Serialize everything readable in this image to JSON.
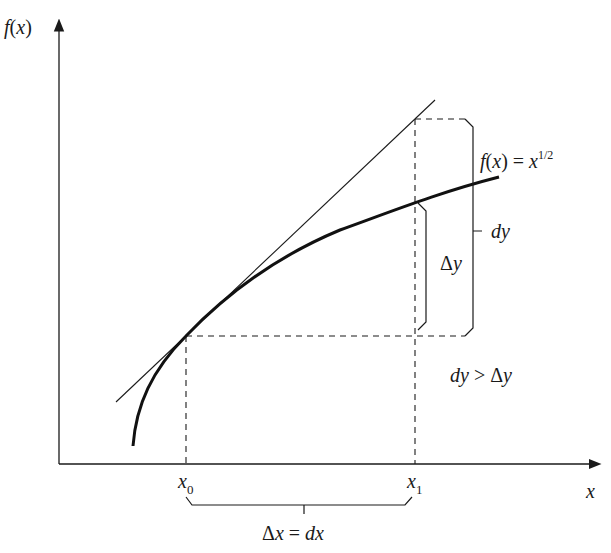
{
  "diagram": {
    "axes": {
      "y_label_f": "f",
      "y_label_open": "(",
      "y_label_x": "x",
      "y_label_close": ")",
      "x_label": "x"
    },
    "function_label": {
      "f": "f",
      "open": "(",
      "x": "x",
      "close": ")",
      "eq": " = ",
      "base": "x",
      "exponent": "1/2"
    },
    "points": {
      "x0_base": "x",
      "x0_sub": "0",
      "x1_base": "x",
      "x1_sub": "1"
    },
    "braces": {
      "delta_y_delta": "Δ",
      "delta_y_var": "y",
      "dy": "dy",
      "dx_label_delta": "Δ",
      "dx_label_x": "x",
      "dx_label_eq": " = ",
      "dx_label_dx": "dx"
    },
    "comparison": {
      "dy": "dy",
      "gt": " > ",
      "delta": "Δ",
      "y": "y"
    },
    "colors": {
      "line": "#1a1a1a",
      "background": "#ffffff"
    }
  }
}
